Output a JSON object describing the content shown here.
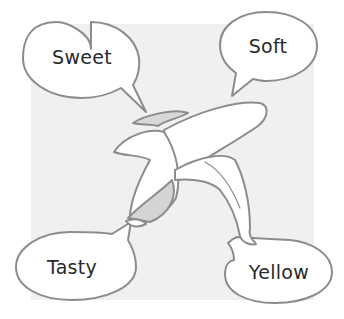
{
  "illustration": {
    "subject": "peeled banana",
    "background_color": "#f0f0f0",
    "outline_color": "#8c8c8c"
  },
  "bubbles": [
    {
      "id": "top-left",
      "text": "Sweet"
    },
    {
      "id": "top-right",
      "text": "Soft"
    },
    {
      "id": "bottom-left",
      "text": "Tasty"
    },
    {
      "id": "bottom-right",
      "text": "Yellow"
    }
  ]
}
